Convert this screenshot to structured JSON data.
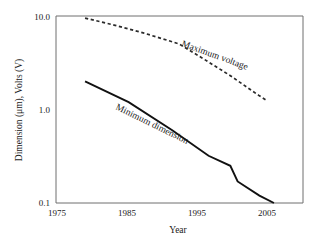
{
  "chart_data": {
    "type": "line",
    "title": "",
    "xlabel": "Year",
    "ylabel": "Dimension (μm), Volts (V)",
    "xlim": [
      1975,
      2009
    ],
    "ylim": [
      0.1,
      10.0
    ],
    "yscale": "log",
    "grid": false,
    "legend": "inline-annotations",
    "xticks": [
      "1975",
      "1985",
      "1995",
      "2005"
    ],
    "xtick_values": [
      1975,
      1985,
      1995,
      2005
    ],
    "yticks": [
      "10.0",
      "1.0",
      "0.1"
    ],
    "ytick_values": [
      10.0,
      1.0,
      0.1
    ],
    "series": [
      {
        "name": "Maximum voltage",
        "style": "dashed",
        "color": "#2a2a2a",
        "x": [
          1979,
          1983,
          1987,
          1991,
          1992,
          1995,
          1999,
          2003,
          2004
        ],
        "y": [
          9.5,
          8.0,
          6.6,
          5.3,
          5.0,
          3.6,
          2.3,
          1.4,
          1.25
        ]
      },
      {
        "name": "Minimum dimension",
        "style": "solid",
        "color": "#111111",
        "x": [
          1979,
          1985,
          1991,
          1996,
          1999,
          2000,
          2003,
          2005
        ],
        "y": [
          2.0,
          1.2,
          0.6,
          0.32,
          0.25,
          0.17,
          0.12,
          0.1
        ]
      }
    ],
    "annotations": [
      {
        "name": "maximum-voltage-label",
        "text": "Maximum voltage",
        "x_px": 181,
        "y_px": 46,
        "rotation": 20
      },
      {
        "name": "minimum-dimension-label",
        "text": "Minimum dimension",
        "x_px": 115,
        "y_px": 109,
        "rotation": 26
      }
    ]
  },
  "axis": {
    "y_label": "Dimension (μm), Volts (V)",
    "x_label": "Year",
    "y_ticks": [
      {
        "label": "10.0",
        "y_px": 17
      },
      {
        "label": "1.0",
        "y_px": 110
      },
      {
        "label": "0.1",
        "y_px": 203
      }
    ],
    "x_ticks": [
      {
        "label": "1975",
        "x_px": 57
      },
      {
        "label": "1985",
        "x_px": 127
      },
      {
        "label": "1995",
        "x_px": 197
      },
      {
        "label": "2005",
        "x_px": 267
      }
    ]
  },
  "colors": {
    "background": "#ffffff",
    "frame": "#6e6e6e",
    "solid_series": "#111111",
    "dashed_series": "#2a2a2a",
    "text": "#1a1a1a"
  }
}
